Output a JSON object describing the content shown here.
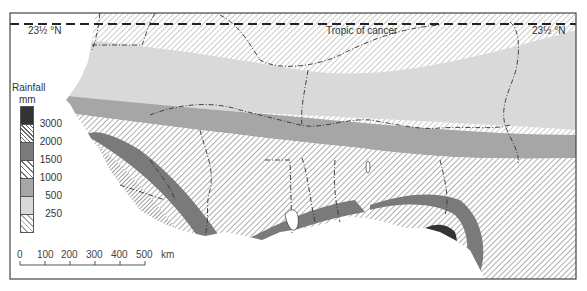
{
  "map": {
    "title": "West Africa Annual Rainfall",
    "labels": {
      "tropic_left": "23½ °N",
      "tropic_right": "23½ °N",
      "tropic_name": "Tropic of cancer"
    },
    "legend": {
      "title_line1": "Rainfall",
      "title_line2": "mm",
      "classes": [
        {
          "label": "3000",
          "fill": "#333333",
          "pattern": "solid",
          "meaning": ">3000"
        },
        {
          "label": "2000",
          "fill": "#ffffff",
          "pattern": "dense-hatch",
          "meaning": "2000-3000"
        },
        {
          "label": "1500",
          "fill": "#7a7a7a",
          "pattern": "solid",
          "meaning": "1500-2000"
        },
        {
          "label": "1000",
          "fill": "#ffffff",
          "pattern": "hatch",
          "meaning": "1000-1500"
        },
        {
          "label": "500",
          "fill": "#a6a6a6",
          "pattern": "solid",
          "meaning": "500-1000"
        },
        {
          "label": "250",
          "fill": "#d9d9d9",
          "pattern": "solid",
          "meaning": "250-500"
        },
        {
          "label": "",
          "fill": "#ffffff",
          "pattern": "light-hatch",
          "meaning": "<250"
        }
      ]
    },
    "scale_bar": {
      "ticks": [
        "0",
        "100",
        "200",
        "300",
        "400",
        "500"
      ],
      "unit": "km"
    },
    "colors": {
      "ocean": "#ffffff",
      "frame": "#444444",
      "borders": "#333333"
    }
  }
}
